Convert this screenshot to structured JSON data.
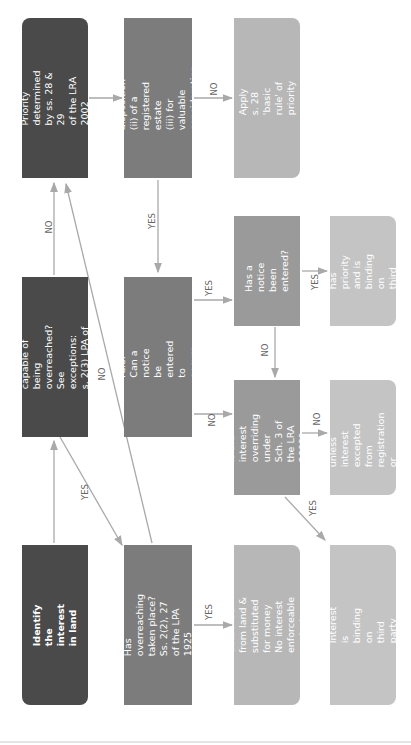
{
  "diagram": {
    "type": "flowchart",
    "orientation": "rotated-90-ccw",
    "colors": {
      "dark": "#4a4a4a",
      "mid": "#7c7c7c",
      "light": "#b7b7b7",
      "line": "#a9a9a9"
    },
    "nodes": {
      "identify": "Identify the interest in land",
      "capable_overreached": "Is the interest capable of being\noverreached?\nSee exceptions: s. 2(3) LPA of the\n1925",
      "priority_lra": "Priority determined by ss. 28 & 29\nof the LRA 2002",
      "has_overreaching": "Has overreaching taken place?\nSs. 2(2), 27 of the LPA 1925",
      "apply_s29": "Apply s. 29 priority rule:\nCan a notice be entered to secure\npriority of the interest?",
      "does_s29_apply": "Does s. 29 apply?\nIs there: (i) a registrable disposition\n(ii) of a registered estate\n(iii) for valuable consideration\n(iv) completed by registration?",
      "interest_detached": "Interest detached from land &\nsubstituted for money\nNo interest enforceable against\nthird party",
      "overriding": "Is the interest overriding\nunder Sch. 3 of the LRA\n2002?",
      "notice_entered": "Has a notice been\nentered?",
      "apply_s28": "Apply s. 28 'basic rule' of priority",
      "binding": "Interest is binding on third party",
      "not_binding": "Interest is not binding on\nthird party unless interest\nexcepted from registration\nor enforceable under a\nconstructive trust",
      "has_priority": "Interest has priority\nand is binding on third\nparty"
    },
    "edge_labels": {
      "yes": "YES",
      "no": "NO"
    }
  }
}
